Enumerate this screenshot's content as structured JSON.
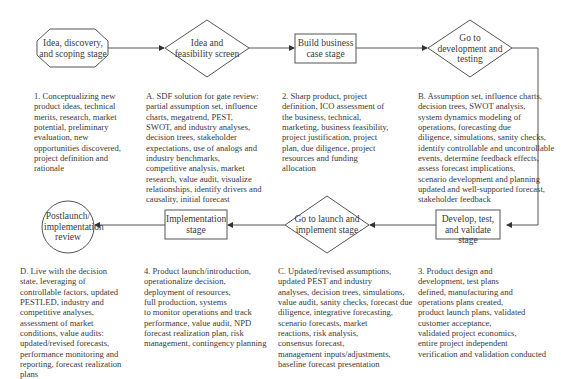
{
  "diagram": {
    "colors": {
      "stroke": "#555555",
      "text": "#3a3a3a",
      "background": "#ffffff"
    },
    "nodes": {
      "idea_discovery": {
        "shape": "octagon",
        "label": "Idea, discovery, and scoping stage"
      },
      "idea_feasibility": {
        "shape": "diamond",
        "label": "Idea and feasibility screen"
      },
      "build_business_case": {
        "shape": "rectangle",
        "label": "Build business case stage"
      },
      "go_to_development": {
        "shape": "diamond",
        "label": "Go to development and testing"
      },
      "develop_test_validate": {
        "shape": "rectangle",
        "label": "Develop, test, and validate stage"
      },
      "go_to_launch": {
        "shape": "diamond",
        "label": "Go to launch and implement stage"
      },
      "implementation": {
        "shape": "rectangle",
        "label": "Implementation stage"
      },
      "postlaunch_review": {
        "shape": "circle",
        "label": "Postlaunch/ implementation review"
      }
    },
    "edges": [
      {
        "from": "idea_discovery",
        "to": "idea_feasibility"
      },
      {
        "from": "idea_feasibility",
        "to": "build_business_case"
      },
      {
        "from": "build_business_case",
        "to": "go_to_development"
      },
      {
        "from": "go_to_development",
        "to": "develop_test_validate"
      },
      {
        "from": "develop_test_validate",
        "to": "go_to_launch"
      },
      {
        "from": "go_to_launch",
        "to": "implementation"
      },
      {
        "from": "implementation",
        "to": "postlaunch_review"
      }
    ],
    "descriptions": {
      "step_1": "1.  Conceptualizing new\nproduct ideas, technical\nmerits, research, market\npotential, preliminary\nevaluation, new\nopportunities discovered,\nproject definition and\nrationale",
      "step_A": "A.  SDF solution for gate review:\npartial assumption set, influence\ncharts, megatrend, PEST,\nSWOT, and industry analyses,\ndecision trees, stakeholder\nexpectations, use of analogs and\nindustry benchmarks,\ncompetitive analysis, market\nresearch, value audit, visualize\nrelationships, identify drivers and\ncausality, initial forecast",
      "step_2": "2.  Sharp product, project\ndefinition, ICO assessment of\nthe business, technical,\nmarketing, business feasibility,\nproject justification, project\nplan, due diligence, project\nresources and funding\nallocation",
      "step_B": "B.  Assumption set, influence charts,\ndecision trees, SWOT analysis,\nsystem dynamics modeling of\noperations, forecasting due\ndiligence, simulations, sanity checks,\nidentify controllable and uncontrollable\nevents, determine feedback effects,\nassess forecast implications,\nscenario development and planning\nupdated and well-supported forecast,\nstakeholder feedback",
      "step_D": "D.  Live with the decision\nstate, leveraging of\ncontrollable factors, updated\nPESTLED, industry and\ncompetitive analyses,\nassessment of market\nconditions, value audits:\nupdated/revised forecasts,\nperformance monitoring and\nreporting, forecast realization\nplans",
      "step_4": "4.  Product launch/introduction,\noperationalize decision,\ndeployment of resources,\nfull production, systems\nto monitor operations and track\nperformance, value audit, NPD\nforecast realization plan, risk\nmanagement, contingency planning",
      "step_C": "C.  Updated/revised assumptions,\nupdated PEST and industry\nanalyses, decision trees, simulations,\nvalue audit, sanity checks, forecast due\ndiligence, integrative forecasting,\nscenario forecasts, market\nreactions, risk analysis,\nconsensus forecast,\nmanagement inputs/adjustments,\nbaseline forecast presentation",
      "step_3": "3.  Product design and\ndevelopment, test plans\ndefined, manufacturing and\noperations plans created,\nproduct launch plans, validated\ncustomer acceptance,\nvalidated project economics,\nentire project independent\nverification and validation conducted"
    }
  }
}
